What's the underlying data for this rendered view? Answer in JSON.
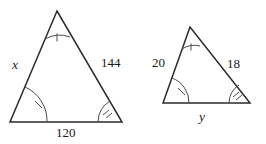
{
  "figure": {
    "stroke_color": "#2b2b2b",
    "mark_color": "#4a4a4a",
    "background_color": "#ffffff",
    "triangles": [
      {
        "name": "large-triangle",
        "vertices": {
          "apex": [
            57,
            11
          ],
          "bottom_left": [
            10,
            122
          ],
          "bottom_right": [
            122,
            122
          ]
        },
        "sides": [
          {
            "name": "left-side",
            "label": "x",
            "is_variable": true
          },
          {
            "name": "right-side",
            "label": "144",
            "is_variable": false
          },
          {
            "name": "bottom-side",
            "label": "120",
            "is_variable": false
          }
        ],
        "angle_marks": [
          {
            "name": "apex-angle",
            "marks": 1,
            "style": "tick"
          },
          {
            "name": "bottom-left-angle",
            "marks": 1,
            "style": "slash"
          },
          {
            "name": "bottom-right-angle",
            "marks": 2,
            "style": "slash"
          }
        ]
      },
      {
        "name": "small-triangle",
        "vertices": {
          "apex": [
            190,
            27
          ],
          "bottom_left": [
            163,
            103
          ],
          "bottom_right": [
            250,
            103
          ]
        },
        "sides": [
          {
            "name": "left-side",
            "label": "20",
            "is_variable": false
          },
          {
            "name": "right-side",
            "label": "18",
            "is_variable": false
          },
          {
            "name": "bottom-side",
            "label": "y",
            "is_variable": true
          }
        ],
        "angle_marks": [
          {
            "name": "apex-angle",
            "marks": 1,
            "style": "tick"
          },
          {
            "name": "bottom-left-angle",
            "marks": 1,
            "style": "slash"
          },
          {
            "name": "bottom-right-angle",
            "marks": 2,
            "style": "slash"
          }
        ]
      }
    ],
    "labels": {
      "large_left": "x",
      "large_right": "144",
      "large_bottom": "120",
      "small_left": "20",
      "small_right": "18",
      "small_bottom": "y"
    }
  }
}
